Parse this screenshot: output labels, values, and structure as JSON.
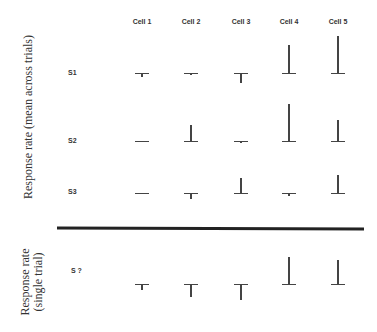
{
  "chart_data": {
    "type": "bar",
    "title": "",
    "categories": [
      "Cell 1",
      "Cell 2",
      "Cell 3",
      "Cell 4",
      "Cell 5"
    ],
    "series": [
      {
        "name": "S1",
        "values": [
          -4,
          -2,
          -10,
          28,
          37
        ]
      },
      {
        "name": "S2",
        "values": [
          0,
          16,
          -2,
          37,
          21
        ]
      },
      {
        "name": "S3",
        "values": [
          0,
          -6,
          15,
          -3,
          18
        ]
      },
      {
        "name": "S ?",
        "values": [
          -6,
          -13,
          -16,
          27,
          24
        ]
      }
    ],
    "ylabel_top": "Response rate (mean across trials)",
    "ylabel_bottom": "Response rate (single trial)",
    "units": "relative pixels (no numeric axis shown)"
  },
  "columns": [
    "Cell 1",
    "Cell 2",
    "Cell 3",
    "Cell 4",
    "Cell 5"
  ],
  "rows": {
    "s1": "S1",
    "s2": "S2",
    "s3": "S3",
    "sq": "S ?"
  },
  "axis": {
    "top_label": "Response rate (mean across trials)",
    "bottom_label_line1": "Response rate",
    "bottom_label_line2": "(single trial)"
  }
}
